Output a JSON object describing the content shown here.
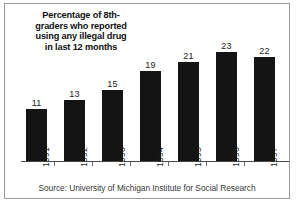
{
  "figure": {
    "title_lines": [
      "Percentage of 8th-",
      "graders who reported",
      "using any illegal drug",
      "in last 12 months"
    ],
    "source_note": "Source: University of Michigan Institute for Social Research"
  },
  "chart_data": {
    "type": "bar",
    "categories": [
      "1991",
      "1992",
      "1993",
      "1994",
      "1995",
      "1996",
      "1997"
    ],
    "values": [
      11,
      13,
      15,
      19,
      21,
      23,
      22
    ],
    "value_labels": [
      "11",
      "13",
      "15",
      "19",
      "21",
      "23",
      "22"
    ],
    "xlabel": "",
    "ylabel": "",
    "ylim": [
      0,
      25
    ],
    "grid": false,
    "legend": false,
    "bar_color": "#141414",
    "background_color": "#ffffff",
    "axis_color": "#4a4a4a",
    "source": "Source: University of Michigan Institute for Social Research"
  }
}
